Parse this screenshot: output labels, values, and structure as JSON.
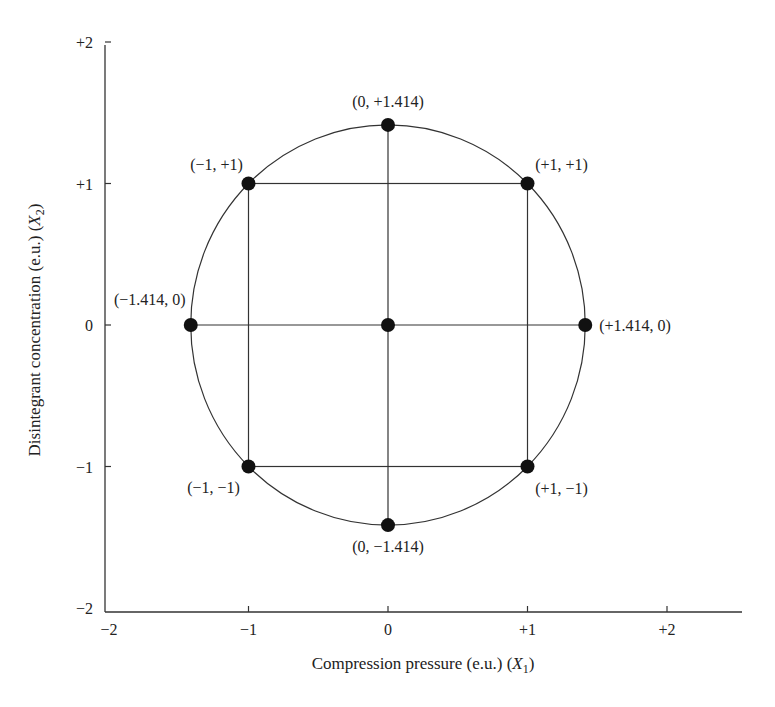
{
  "chart_data": {
    "type": "scatter",
    "title": "",
    "xlabel": "Compression pressure (e.u.) (X1)",
    "xlabel_parts": {
      "main": "Compression pressure (e.u.) (",
      "var": "X",
      "sub": "1",
      "end": ")"
    },
    "ylabel": "Disintegrant concentration (e.u.) (X2)",
    "ylabel_parts": {
      "main": "Disintegrant concentration (e.u.) (",
      "var": "X",
      "sub": "2",
      "end": ")"
    },
    "xlim": [
      -2,
      2.55
    ],
    "ylim": [
      -2,
      2
    ],
    "x_ticks": [
      "−2",
      "−1",
      "0",
      "+1",
      "+2"
    ],
    "x_tick_values": [
      -2,
      -1,
      0,
      1,
      2
    ],
    "y_ticks": [
      "+2",
      "+1",
      "0",
      "−1",
      "−2"
    ],
    "y_tick_values": [
      2,
      1,
      0,
      -1,
      -2
    ],
    "grid": false,
    "legend": null,
    "points": [
      {
        "x": 0,
        "y": 1.414,
        "label": "(0, +1.414)"
      },
      {
        "x": -1,
        "y": 1,
        "label": "(−1, +1)"
      },
      {
        "x": 1,
        "y": 1,
        "label": "(+1, +1)"
      },
      {
        "x": -1.414,
        "y": 0,
        "label": "(−1.414, 0)"
      },
      {
        "x": 0,
        "y": 0,
        "label": ""
      },
      {
        "x": 1.414,
        "y": 0,
        "label": "(+1.414, 0)"
      },
      {
        "x": -1,
        "y": -1,
        "label": "(−1, −1)"
      },
      {
        "x": 1,
        "y": -1,
        "label": "(+1, −1)"
      },
      {
        "x": 0,
        "y": -1.414,
        "label": "(0, −1.414)"
      }
    ],
    "circle": {
      "cx": 0,
      "cy": 0,
      "r": 1.414
    },
    "square": {
      "x_min": -1,
      "x_max": 1,
      "y_min": -1,
      "y_max": 1
    },
    "crosshair_lines": [
      {
        "from": [
          0,
          -1.414
        ],
        "to": [
          0,
          1.414
        ]
      },
      {
        "from": [
          -1.414,
          0
        ],
        "to": [
          1.414,
          0
        ]
      }
    ]
  },
  "colors": {
    "line": "#333333",
    "point": "#111111",
    "text": "#222222",
    "background": "#ffffff"
  }
}
